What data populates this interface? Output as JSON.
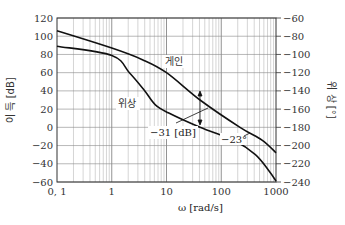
{
  "chart_data": {
    "type": "line",
    "title": "",
    "xlabel": "ω [rad/s]",
    "ylabel_left": "이 득 [dB]",
    "ylabel_right": "위 상 [°]",
    "xscale": "log",
    "xlim": [
      0.1,
      1000
    ],
    "ylim_left": [
      -60,
      120
    ],
    "ylim_right": [
      -240,
      -60
    ],
    "x_ticks": [
      0.1,
      1,
      10,
      100,
      1000
    ],
    "x_tick_labels": [
      "0, 1",
      "1",
      "10",
      "100",
      "1000"
    ],
    "y_ticks_left": [
      120,
      100,
      80,
      60,
      40,
      20,
      0,
      -20,
      -40,
      -60
    ],
    "y_ticks_right": [
      -60,
      -80,
      -100,
      -120,
      -140,
      -160,
      -180,
      -200,
      -220,
      -240
    ],
    "grid": true,
    "series": [
      {
        "name": "게인",
        "axis": "left",
        "points": [
          [
            0.1,
            106
          ],
          [
            1,
            87
          ],
          [
            3.7,
            74
          ],
          [
            10,
            60
          ],
          [
            41,
            30
          ],
          [
            220,
            0
          ],
          [
            555,
            -14
          ],
          [
            1000,
            -28
          ]
        ]
      },
      {
        "name": "위상",
        "axis": "right",
        "points": [
          [
            0.1,
            -91
          ],
          [
            1,
            -101
          ],
          [
            2.1,
            -120
          ],
          [
            3.9,
            -139
          ],
          [
            6.2,
            -155
          ],
          [
            10.8,
            -164
          ],
          [
            41,
            -180
          ],
          [
            180,
            -195
          ],
          [
            420,
            -210
          ],
          [
            730,
            -227
          ],
          [
            1000,
            -239
          ]
        ]
      }
    ],
    "annotations": [
      {
        "text": "게인",
        "x": 13,
        "y": 93
      },
      {
        "text": "위상",
        "x": 1.1,
        "y": -150
      },
      {
        "text": "−31 [dB]",
        "x": 12,
        "y": -182,
        "meaning": "gain margin at phase crossover ω≈41"
      },
      {
        "text": "−23°",
        "x": 190,
        "y": -193,
        "meaning": "phase margin"
      }
    ]
  }
}
